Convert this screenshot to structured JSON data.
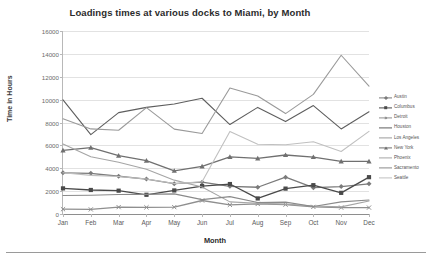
{
  "chart_data": {
    "type": "line",
    "title": "Loadings times at various docks to Miami, by Month",
    "xlabel": "Month",
    "ylabel": "Time in Hours",
    "categories": [
      "Jan",
      "Feb",
      "Mar",
      "Apr",
      "May",
      "Jun",
      "Jul",
      "Aug",
      "Sep",
      "Oct",
      "Nov",
      "Dec"
    ],
    "ylim": [
      0,
      16000
    ],
    "yticks": [
      0,
      2000,
      4000,
      6000,
      8000,
      10000,
      12000,
      14000,
      16000
    ],
    "ytick_labels": [
      "0",
      "2000",
      "4000",
      "6000",
      "8000",
      "10000",
      "12000",
      "14000",
      "16000"
    ],
    "grid": true,
    "legend_position": "right",
    "series": [
      {
        "name": "Austin",
        "color": "#7b7b7b",
        "marker": "diamond",
        "values": [
          3600,
          3560,
          3300,
          3050,
          2650,
          2780,
          2420,
          2340,
          3220,
          2300,
          2400,
          2640
        ]
      },
      {
        "name": "Columbus",
        "color": "#4a4a4a",
        "marker": "square",
        "values": [
          2240,
          2100,
          2040,
          1680,
          2060,
          2440,
          2620,
          1360,
          2220,
          2520,
          1850,
          3220
        ]
      },
      {
        "name": "Detroit",
        "color": "#8f8f8f",
        "marker": "x",
        "values": [
          420,
          400,
          600,
          580,
          600,
          1180,
          800,
          880,
          820,
          620,
          560,
          560
        ]
      },
      {
        "name": "Houston",
        "color": "#5e5e5e",
        "marker": "none",
        "values": [
          9980,
          6940,
          8860,
          9320,
          9620,
          10120,
          7820,
          9320,
          8080,
          9480,
          7440,
          8940
        ]
      },
      {
        "name": "Los Angeles",
        "color": "#9a9a9a",
        "marker": "none",
        "values": [
          8320,
          7440,
          7320,
          9300,
          7420,
          7040,
          11020,
          10320,
          8780,
          10460,
          13880,
          11180
        ]
      },
      {
        "name": "New York",
        "color": "#707070",
        "marker": "triangle",
        "values": [
          5560,
          5800,
          5100,
          4660,
          3780,
          4160,
          5000,
          4860,
          5160,
          4980,
          4600,
          4600
        ]
      },
      {
        "name": "Phoenix",
        "color": "#a5a5a5",
        "marker": "none",
        "values": [
          6120,
          5000,
          4520,
          3920,
          2960,
          2360,
          1060,
          940,
          860,
          700,
          620,
          1140
        ]
      },
      {
        "name": "Sacramento",
        "color": "#8a8a8a",
        "marker": "none",
        "values": [
          1620,
          1640,
          1700,
          1720,
          1760,
          1260,
          1520,
          1000,
          1040,
          660,
          1060,
          1220
        ]
      },
      {
        "name": "Seattle",
        "color": "#c0c0c0",
        "marker": "none",
        "values": [
          3600,
          3380,
          3280,
          3060,
          2660,
          2820,
          7220,
          6100,
          6060,
          6320,
          5460,
          7220
        ]
      }
    ]
  }
}
